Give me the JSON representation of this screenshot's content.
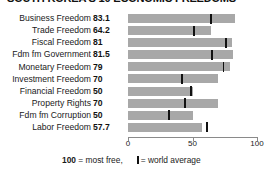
{
  "title": "SOUTH KOREA'S 10 ECONOMIC FREEDOMS",
  "footnote": {
    "most_free_prefix": "100",
    "most_free_text": " = most free,",
    "legend_text": "= world average",
    "legend_swatch_name": "world-average-tick-swatch"
  },
  "colors": {
    "bar": "#a8a8a8",
    "tick": "#111111",
    "axis": "#8a8a8a",
    "text": "#1a1a1a"
  },
  "chart_data": {
    "type": "bar",
    "orientation": "horizontal",
    "title": "SOUTH KOREA'S 10 ECONOMIC FREEDOMS",
    "xlabel": "",
    "ylabel": "",
    "xlim": [
      0,
      100
    ],
    "xticks": [
      0,
      50,
      100
    ],
    "xtick_labels": [
      "0",
      "50",
      "100"
    ],
    "grid": false,
    "legend_position": "bottom",
    "categories": [
      "Business Freedom",
      "Trade Freedom",
      "Fiscal Freedom",
      "Fdm fm Government",
      "Monetary Freedom",
      "Investment Freedom",
      "Financial Freedom",
      "Property Rights",
      "Fdm fm Corruption",
      "Labor Freedom"
    ],
    "series": [
      {
        "name": "South Korea",
        "values": [
          83.1,
          64.2,
          81,
          81.5,
          79,
          70,
          50,
          70,
          50,
          57.7
        ],
        "value_labels": [
          "83.1",
          "64.2",
          "81",
          "81.5",
          "79",
          "70",
          "50",
          "70",
          "50",
          "57.7"
        ]
      },
      {
        "name": "world average",
        "marker": "vertical-tick",
        "values": [
          64.5,
          51.0,
          76.0,
          65.0,
          74.0,
          42.0,
          49.0,
          44.0,
          32.0,
          61.5
        ]
      }
    ]
  }
}
